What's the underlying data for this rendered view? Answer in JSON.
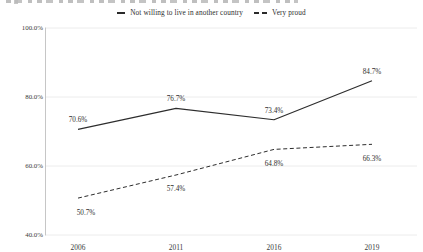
{
  "window": {
    "width": 423,
    "height": 252,
    "background": "#ffffff"
  },
  "legend": {
    "items": [
      {
        "label": "Not willing to live in another country",
        "marker": "solid-line"
      },
      {
        "label": "Very proud",
        "marker": "dashed-line"
      }
    ]
  },
  "chart_data": {
    "type": "line",
    "title": "",
    "categories": [
      "2006",
      "2011",
      "2016",
      "2019"
    ],
    "series": [
      {
        "name": "Not willing to live in another country",
        "line_style": "solid",
        "values": [
          70.6,
          76.7,
          73.4,
          84.7
        ],
        "point_labels": [
          "70.6%",
          "76.7%",
          "73.4%",
          "84.7%"
        ],
        "label_placement": "above"
      },
      {
        "name": "Very proud",
        "line_style": "dashed",
        "values": [
          50.7,
          57.4,
          64.8,
          66.3
        ],
        "point_labels": [
          "50.7%",
          "57.4%",
          "64.8%",
          "66.3%"
        ],
        "label_placement": "below"
      }
    ],
    "ylim": [
      40,
      100
    ],
    "y_ticks": [
      {
        "value": 100,
        "label": "100.0%"
      },
      {
        "value": 80,
        "label": "80.0%"
      },
      {
        "value": 60,
        "label": "60.0%"
      },
      {
        "value": 40,
        "label": "40.0%"
      }
    ],
    "xlabel": "",
    "ylabel": "",
    "grid": true,
    "legend_position": "top-center",
    "colors": {
      "line": "#2d2d2d",
      "grid": "#ececec",
      "axis": "#c6c6c6",
      "tick_text": "#3b3b3b",
      "label_text": "#2e2e2e"
    }
  }
}
